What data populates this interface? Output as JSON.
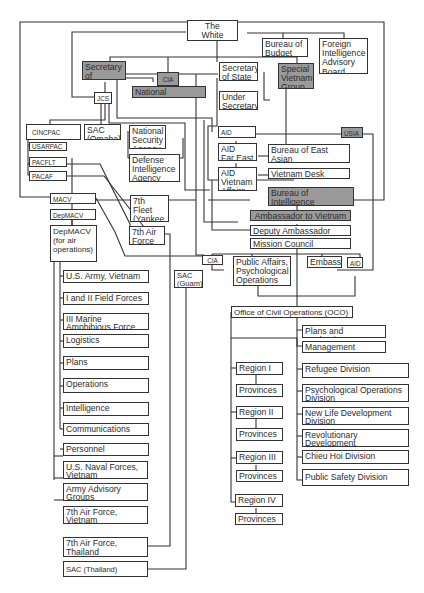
{
  "diagram": {
    "type": "organization-chart",
    "colors": {
      "line": "#333333",
      "highlight_fill": "#9a9a9a",
      "box_fill": "#ffffff"
    },
    "nodes": {
      "white_house": "The\nWhite House",
      "bureau_budget": "Bureau of\nBudget",
      "fiab": "Foreign\nIntelligence\nAdvisory\nBoard",
      "secdef": "Secretary\nof Defense",
      "cia_top": "CIA",
      "national_estimates": "National Estimates",
      "secstate": "Secretary\nof State",
      "special_vietnam_group": "Special\nVietnam\nGroup",
      "under_secretary": "Under\nSecretary",
      "jcs": "JCS",
      "cincpac": "CINCPAC",
      "sac_omaha": "SAC\n(Omaha)",
      "nsa": "National\nSecurity\nAgency",
      "dia": "Defense\nIntelligence\nAgency",
      "usarpac": "USARPAC",
      "pacflt": "PACFLT",
      "pacaf": "PACAF",
      "aid_top": "AID",
      "usia": "USIA",
      "aid_far_east": "AID\nFar East",
      "bureau_eap": "Bureau of East Asian\nand Pacific Affairs",
      "aid_vietnam": "AID\nVietnam\nAffairs",
      "vietnam_desk": "Vietnam Desk",
      "inr": "Bureau of Intelligence\nand Research",
      "macv": "MACV",
      "depmacv": "DepMACV",
      "depmacv_air": "DepMACV\n(for air\noperations)",
      "seventh_fleet": "7th Fleet\n(Yankee\nStation)",
      "seventh_af": "7th Air\nForce",
      "ambassador": "Ambassador to Vietnam",
      "deputy_ambassador": "Deputy Ambassador",
      "mission_council": "Mission Council",
      "cia_mission": "CIA",
      "public_affairs": "Public Affairs,\nPsychological\nOperations",
      "embassy": "Embassy",
      "aid_mission": "AID",
      "sac_guam": "SAC\n(Guam)",
      "us_army_vn": "U.S. Army, Vietnam",
      "field_forces": "I and II Field Forces",
      "marine_force": "III Marine\nAmphibious Force",
      "logistics": "Logistics",
      "plans": "Plans",
      "operations": "Operations",
      "intelligence": "Intelligence",
      "communications": "Communications",
      "personnel": "Personnel",
      "naval_forces": "U.S. Naval Forces,\nVietnam",
      "army_advisory": "Army Advisory\nGroups",
      "seventh_af_vn": "7th Air Force,\nVietnam",
      "seventh_af_th": "7th Air Force,\nThailand",
      "sac_thailand": "SAC (Thailand)",
      "oco": "Office of Civil Operations (OCO)",
      "plans_eval": "Plans and Evaluation",
      "management": "Management",
      "region1": "Region I",
      "prov1": "Provinces",
      "region2": "Region II",
      "prov2": "Provinces",
      "region3": "Region III",
      "prov3": "Provinces",
      "region4": "Region IV",
      "prov4": "Provinces",
      "refugee": "Refugee Division",
      "psyops": "Psychological Operations\nDivision",
      "new_life": "New Life Development\nDivision",
      "rev_dev": "Revolutionary Development\nDivision",
      "chieu_hoi": "Chieu Hoi Division",
      "public_safety": "Public Safety Division"
    }
  }
}
